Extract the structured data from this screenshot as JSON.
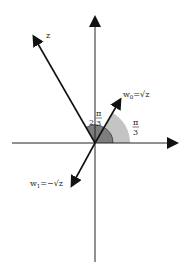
{
  "diagram": {
    "origin": {
      "x": 95,
      "y": 143
    },
    "colors": {
      "axis": "#222222",
      "vector": "#111111",
      "arc_large": "#bdbdbd",
      "arc_small": "#7a7a7a",
      "background": "#ffffff"
    },
    "vectors": [
      {
        "id": "z",
        "label": "z",
        "angle_label": "2π/3"
      },
      {
        "id": "w0",
        "label_main": "w",
        "label_sub": "0",
        "label_rest": "=√z"
      },
      {
        "id": "w1",
        "label_main": "w",
        "label_sub": "1",
        "label_rest": "=−√z"
      }
    ],
    "angles": {
      "large": {
        "coef": "2",
        "num": "π",
        "den": "3"
      },
      "small": {
        "num": "π",
        "den": "3"
      }
    }
  }
}
